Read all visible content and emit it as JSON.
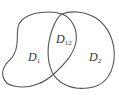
{
  "diagram": {
    "type": "set-regions",
    "regions": [
      {
        "id": "D1",
        "label": "D",
        "subscript": "1"
      },
      {
        "id": "D2",
        "label": "D",
        "subscript": "2"
      },
      {
        "id": "D12",
        "label": "D",
        "subscript": "12"
      }
    ],
    "stroke_color": "#555555",
    "background": "#ffffff"
  }
}
